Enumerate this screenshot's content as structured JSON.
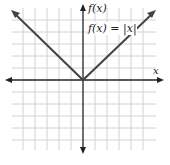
{
  "graph": {
    "y_axis_label": "f(x)",
    "x_axis_label": "x",
    "function_label": "f(x) = |x|",
    "function": "absolute value",
    "colors": {
      "grid": "#cfcfcf",
      "axis": "#222222",
      "curve": "#444444"
    }
  }
}
